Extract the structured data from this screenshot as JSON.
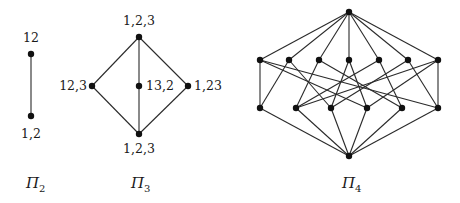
{
  "figure": {
    "background": "#ffffff",
    "ink": "#1a1a1a",
    "lattices": [
      {
        "name": "Pi_2",
        "caption_base": "Π",
        "caption_sub": "2",
        "caption_pos": [
          26,
          188
        ],
        "nodes": [
          {
            "id": "top",
            "x": 31,
            "y": 54,
            "label": "12",
            "lx": 31,
            "ly": 42,
            "anchor": "middle"
          },
          {
            "id": "bot",
            "x": 31,
            "y": 116,
            "label": "1,2",
            "lx": 31,
            "ly": 138,
            "anchor": "middle"
          }
        ],
        "edges": [
          [
            "top",
            "bot"
          ]
        ]
      },
      {
        "name": "Pi_3",
        "caption_base": "Π",
        "caption_sub": "3",
        "caption_pos": [
          131,
          188
        ],
        "nodes": [
          {
            "id": "top",
            "x": 139,
            "y": 37,
            "label": "1,2,3",
            "lx": 139,
            "ly": 25,
            "anchor": "middle"
          },
          {
            "id": "left",
            "x": 92,
            "y": 86,
            "label": "12,3",
            "lx": 87,
            "ly": 90,
            "anchor": "end"
          },
          {
            "id": "mid",
            "x": 139,
            "y": 86,
            "label": "13,2",
            "lx": 146,
            "ly": 90,
            "anchor": "start"
          },
          {
            "id": "right",
            "x": 188,
            "y": 86,
            "label": "1,23",
            "lx": 194,
            "ly": 90,
            "anchor": "start"
          },
          {
            "id": "bot",
            "x": 139,
            "y": 134,
            "label": "1,2,3",
            "lx": 139,
            "ly": 153,
            "anchor": "middle"
          }
        ],
        "edges": [
          [
            "top",
            "left"
          ],
          [
            "top",
            "mid"
          ],
          [
            "top",
            "right"
          ],
          [
            "left",
            "bot"
          ],
          [
            "mid",
            "bot"
          ],
          [
            "right",
            "bot"
          ]
        ]
      },
      {
        "name": "Pi_4",
        "caption_base": "Π",
        "caption_sub": "4",
        "caption_pos": [
          342,
          188
        ],
        "nodes": [
          {
            "id": "T",
            "x": 349,
            "y": 12
          },
          {
            "id": "U1",
            "x": 260,
            "y": 60
          },
          {
            "id": "U2",
            "x": 289,
            "y": 60
          },
          {
            "id": "U3",
            "x": 319,
            "y": 60
          },
          {
            "id": "U4",
            "x": 349,
            "y": 60
          },
          {
            "id": "U5",
            "x": 379,
            "y": 60
          },
          {
            "id": "U6",
            "x": 408,
            "y": 60
          },
          {
            "id": "U7",
            "x": 438,
            "y": 60
          },
          {
            "id": "L1",
            "x": 260,
            "y": 108
          },
          {
            "id": "L2",
            "x": 296,
            "y": 108
          },
          {
            "id": "L3",
            "x": 331,
            "y": 108
          },
          {
            "id": "L4",
            "x": 367,
            "y": 108
          },
          {
            "id": "L5",
            "x": 402,
            "y": 108
          },
          {
            "id": "L6",
            "x": 438,
            "y": 108
          },
          {
            "id": "B",
            "x": 349,
            "y": 156
          }
        ],
        "edges": [
          [
            "T",
            "U1"
          ],
          [
            "T",
            "U2"
          ],
          [
            "T",
            "U3"
          ],
          [
            "T",
            "U4"
          ],
          [
            "T",
            "U5"
          ],
          [
            "T",
            "U6"
          ],
          [
            "T",
            "U7"
          ],
          [
            "U1",
            "L1"
          ],
          [
            "U1",
            "L4"
          ],
          [
            "U1",
            "L6"
          ],
          [
            "U2",
            "L1"
          ],
          [
            "U2",
            "L3"
          ],
          [
            "U3",
            "L2"
          ],
          [
            "U3",
            "L5"
          ],
          [
            "U4",
            "L3"
          ],
          [
            "U4",
            "L4"
          ],
          [
            "U5",
            "L2"
          ],
          [
            "U5",
            "L5"
          ],
          [
            "U6",
            "L3"
          ],
          [
            "U6",
            "L6"
          ],
          [
            "U7",
            "L2"
          ],
          [
            "U7",
            "L4"
          ],
          [
            "U7",
            "L6"
          ],
          [
            "L1",
            "B"
          ],
          [
            "L2",
            "B"
          ],
          [
            "L3",
            "B"
          ],
          [
            "L4",
            "B"
          ],
          [
            "L5",
            "B"
          ],
          [
            "L6",
            "B"
          ]
        ]
      }
    ]
  }
}
